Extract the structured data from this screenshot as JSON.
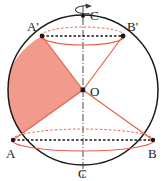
{
  "figure": {
    "background_color": "#ffffff",
    "colors": {
      "outline": "#1a1a1a",
      "accent_red": "#e8604c",
      "sector_fill": "#f29a8c",
      "sector_fill_edge": "#e8604c",
      "axis": "#4a4a4a",
      "label": "#1a1a1a"
    },
    "geometry": {
      "circle": {
        "cx": 83,
        "cy": 90,
        "r": 75
      },
      "axis": {
        "x": 83,
        "y_top": 4,
        "y_bottom": 178
      },
      "top_ellipse": {
        "cx": 83,
        "cy": 36,
        "rx": 42,
        "ry": 9
      },
      "bottom_ellipse": {
        "cx": 83,
        "cy": 140,
        "rx": 71,
        "ry": 11
      }
    },
    "points": [
      {
        "name": "C-top",
        "label": "C",
        "x": 83,
        "y": 16,
        "label_x": 90,
        "label_y": 18,
        "dot": true
      },
      {
        "name": "A-prime",
        "label": "A'",
        "x": 42,
        "y": 36,
        "label_x": 28,
        "label_y": 30,
        "dot": true
      },
      {
        "name": "B-prime",
        "label": "B'",
        "x": 123,
        "y": 36,
        "label_x": 127,
        "label_y": 30,
        "dot": true
      },
      {
        "name": "O-center",
        "label": "O",
        "x": 83,
        "y": 90,
        "label_x": 90,
        "label_y": 94,
        "dot": true
      },
      {
        "name": "A-lower",
        "label": "A",
        "x": 13,
        "y": 140,
        "label_x": 8,
        "label_y": 155,
        "dot": true
      },
      {
        "name": "B-lower",
        "label": "B",
        "x": 153,
        "y": 140,
        "label_x": 148,
        "label_y": 155,
        "dot": true
      },
      {
        "name": "C-bottom",
        "label": "C",
        "x": 83,
        "y": 165,
        "label_x": 79,
        "label_y": 176,
        "dot": false
      }
    ],
    "radii": [
      {
        "name": "radius-O-to-A-prime",
        "from": "O",
        "to": "A'",
        "style": "solid",
        "color": "#e8604c"
      },
      {
        "name": "radius-O-to-B-prime",
        "from": "O",
        "to": "B'",
        "style": "solid",
        "color": "#e8604c"
      },
      {
        "name": "radius-O-to-A",
        "from": "O",
        "to": "A",
        "style": "solid",
        "color": "#e8604c"
      },
      {
        "name": "radius-O-to-B",
        "from": "O",
        "to": "B",
        "style": "solid",
        "color": "#e8604c"
      }
    ],
    "chords": [
      {
        "name": "chord-A-prime-B-prime",
        "style": "dashed",
        "color": "#1a1a1a"
      },
      {
        "name": "chord-A-B",
        "style": "dashed",
        "color": "#1a1a1a"
      }
    ],
    "sector": {
      "name": "shaded-sector-A-prime-O-A",
      "vertices": [
        "A'",
        "O",
        "A"
      ],
      "arc_side": "left",
      "fill": "#f29a8c"
    },
    "rotation_arrow": {
      "name": "rotation-arrow",
      "description": "curved arrow encircling the vertical axis indicating rotation",
      "color": "#3a3a3a"
    }
  }
}
